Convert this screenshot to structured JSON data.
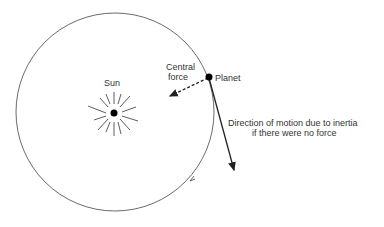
{
  "diagram": {
    "labels": {
      "sun": "Sun",
      "central_force_1": "Central",
      "central_force_2": "force",
      "planet": "Planet",
      "inertia_1": "Direction of motion due to inertia",
      "inertia_2": "if there were no force"
    },
    "elements": {
      "orbit": {
        "cx": 115,
        "cy": 112,
        "r": 99
      },
      "sun": {
        "cx": 114,
        "cy": 113
      },
      "planet": {
        "cx": 209,
        "cy": 77
      },
      "colors": {
        "line": "#333333",
        "fill": "#000000"
      }
    }
  }
}
